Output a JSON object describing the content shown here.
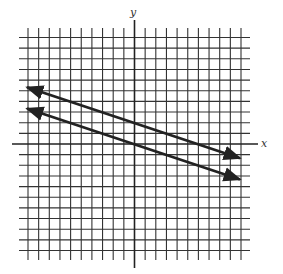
{
  "chart_data": {
    "type": "line",
    "title": "",
    "xlabel": "x",
    "ylabel": "y",
    "xlim": [
      -10,
      10
    ],
    "ylim": [
      -10,
      10
    ],
    "grid": true,
    "grid_step": 1,
    "legend": null,
    "series": [
      {
        "name": "upper line",
        "equation": "y = -x/3 + 2",
        "slope": -0.3333,
        "intercept": 2,
        "x": [
          -10,
          10
        ],
        "y": [
          5.33,
          -1.33
        ],
        "arrows": "both"
      },
      {
        "name": "lower line",
        "equation": "y = -x/3",
        "slope": -0.3333,
        "intercept": 0,
        "x": [
          -10,
          10
        ],
        "y": [
          3.33,
          -3.33
        ],
        "arrows": "both"
      }
    ]
  },
  "labels": {
    "x": "x",
    "y": "y"
  },
  "colors": {
    "grid": "#333333",
    "axis": "#222222",
    "line": "#222222"
  }
}
